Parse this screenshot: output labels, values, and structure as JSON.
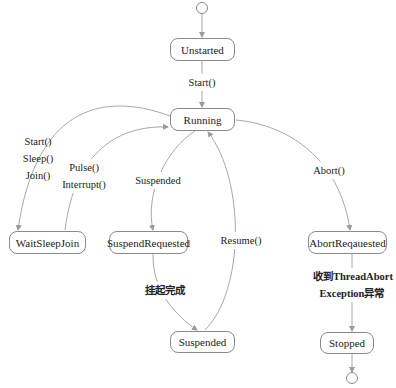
{
  "diagram": {
    "type": "state-machine",
    "initial_state": "Unstarted",
    "final_state": "Stopped",
    "nodes": {
      "unstarted": "Unstarted",
      "running": "Running",
      "waitsleepjoin": "WaitSleepJoin",
      "suspendrequested": "SuspendRequested",
      "suspended": "Suspended",
      "abortrequested": "AbortReqauested",
      "stopped": "Stopped"
    },
    "edges": {
      "start": {
        "from": "Unstarted",
        "to": "Running",
        "label": "Start()"
      },
      "to_wait": {
        "from": "Running",
        "to": "WaitSleepJoin",
        "label_lines": [
          "Start()",
          "Sleep()",
          "Join()"
        ]
      },
      "from_wait": {
        "from": "WaitSleepJoin",
        "to": "Running",
        "label_lines": [
          "Pulse()",
          "Interrupt()"
        ]
      },
      "suspend": {
        "from": "Running",
        "to": "SuspendRequested",
        "label": "Suspended"
      },
      "suspend_done": {
        "from": "SuspendRequested",
        "to": "Suspended",
        "label": "挂起完成"
      },
      "resume": {
        "from": "Suspended",
        "to": "Running",
        "label": "Resume()"
      },
      "abort": {
        "from": "Running",
        "to": "AbortReqauested",
        "label": "Abort()"
      },
      "abort_exception": {
        "from": "AbortReqauested",
        "to": "Stopped",
        "label_lines": [
          "收到ThreadAbort",
          "Exception异常"
        ]
      }
    },
    "colors": {
      "line": "#9a9a9a",
      "border": "#8a8a8a",
      "text": "#222222",
      "background": "#ffffff"
    }
  }
}
